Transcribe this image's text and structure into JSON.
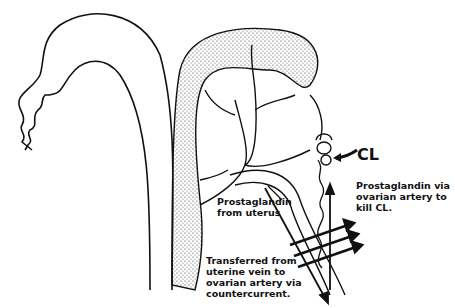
{
  "diagram": {
    "type": "anatomical-illustration",
    "labels": {
      "corpus_luteum": "CL",
      "prostaglandin_ovarian": "Prostaglandin via\novarian artery to\nkill CL.",
      "prostaglandin_uterus": "Prostaglandin\nfrom uterus",
      "countercurrent_transfer": "Transferred from\nuterine vein to\novarian artery via\ncountercurrent."
    },
    "colors": {
      "ink": "#111111",
      "background": "#ffffff"
    }
  }
}
